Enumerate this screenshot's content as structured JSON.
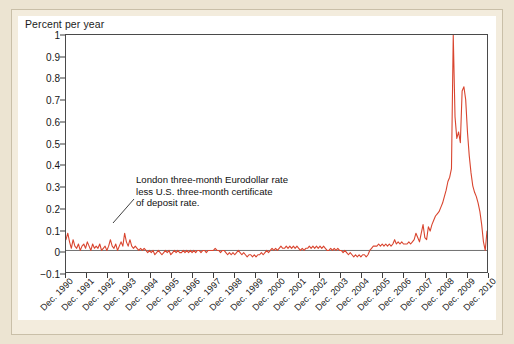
{
  "chart_data": {
    "type": "line",
    "title": "",
    "ylabel": "Percent per year",
    "xlabel": "",
    "ylim": [
      -0.1,
      1
    ],
    "grid": false,
    "legend_position": "none",
    "line_color": "#d9452f",
    "zero_line_color": "#6e6e6e",
    "y_ticks": [
      1,
      0.9,
      0.8,
      0.7,
      0.6,
      0.5,
      0.4,
      0.3,
      0.2,
      0.1,
      0,
      -0.1
    ],
    "y_tick_labels": [
      "1",
      "0.9",
      "0.8",
      "0.7",
      "0.6",
      "0.5",
      "0.4",
      "0.3",
      "0.2",
      "0.1",
      "0",
      "−0.1"
    ],
    "x_tick_labels": [
      "Dec. 1990",
      "Dec. 1991",
      "Dec. 1992",
      "Dec. 1993",
      "Dec. 1994",
      "Dec. 1995",
      "Dec. 1996",
      "Dec. 1997",
      "Dec. 1998",
      "Dec. 1999",
      "Dec. 2000",
      "Dec. 2001",
      "Dec. 2002",
      "Dec. 2003",
      "Dec. 2004",
      "Dec. 2005",
      "Dec. 2006",
      "Dec. 2007",
      "Dec. 2008",
      "Dec. 2009",
      "Dec. 2010"
    ],
    "xlim_labels": [
      "Dec. 1990",
      "Dec. 2010"
    ],
    "annotations": [
      {
        "name": "series-label",
        "lines": [
          "London three-month Eurodollar rate",
          "less U.S. three-month certificate",
          "of deposit rate."
        ],
        "leader_line": true
      }
    ],
    "series": [
      {
        "name": "London three-month Eurodollar rate less U.S. three-month certificate of deposit rate",
        "x_start": 1990.92,
        "x_step_years": 0.0833,
        "values": [
          0.05,
          0.08,
          0.04,
          0.01,
          0.05,
          0.02,
          0.01,
          0.03,
          0.0,
          0.02,
          0.03,
          0.01,
          0.04,
          0.02,
          0.0,
          0.03,
          0.01,
          0.02,
          0.01,
          0.03,
          0.0,
          0.01,
          0.02,
          0.0,
          0.02,
          0.05,
          0.02,
          0.01,
          0.03,
          0.0,
          0.02,
          0.04,
          0.02,
          0.08,
          0.04,
          0.02,
          0.05,
          0.02,
          0.01,
          0.02,
          0.01,
          0.0,
          0.01,
          0.0,
          0.01,
          0.0,
          -0.01,
          0.0,
          -0.01,
          0.0,
          -0.02,
          -0.01,
          0.0,
          -0.01,
          -0.02,
          -0.01,
          0.0,
          -0.01,
          0.0,
          -0.02,
          -0.01,
          0.0,
          -0.01,
          0.0,
          -0.01,
          -0.01,
          0.0,
          -0.01,
          0.0,
          -0.01,
          0.0,
          -0.01,
          0.0,
          -0.01,
          0.0,
          0.0,
          -0.01,
          0.0,
          0.0,
          -0.01,
          0.0,
          0.0,
          0.0,
          0.0,
          0.01,
          0.0,
          0.0,
          -0.01,
          0.0,
          0.0,
          -0.01,
          -0.02,
          -0.01,
          -0.02,
          -0.01,
          -0.02,
          -0.01,
          0.0,
          -0.01,
          -0.02,
          -0.01,
          -0.02,
          -0.03,
          -0.02,
          -0.02,
          -0.03,
          -0.02,
          -0.03,
          -0.02,
          -0.02,
          -0.01,
          -0.02,
          -0.01,
          0.0,
          -0.01,
          0.0,
          0.01,
          0.0,
          0.01,
          0.0,
          0.01,
          0.02,
          0.01,
          0.01,
          0.02,
          0.01,
          0.02,
          0.01,
          0.02,
          0.01,
          0.02,
          0.01,
          0.0,
          0.01,
          0.0,
          0.01,
          0.01,
          0.02,
          0.01,
          0.02,
          0.01,
          0.02,
          0.01,
          0.02,
          0.01,
          0.02,
          0.01,
          0.0,
          0.0,
          0.01,
          0.0,
          0.01,
          0.0,
          0.01,
          0.0,
          0.0,
          -0.01,
          0.0,
          -0.01,
          -0.02,
          -0.01,
          -0.02,
          -0.03,
          -0.02,
          -0.03,
          -0.02,
          -0.03,
          -0.02,
          -0.02,
          -0.03,
          -0.02,
          0.0,
          0.01,
          0.02,
          0.02,
          0.02,
          0.03,
          0.02,
          0.03,
          0.02,
          0.03,
          0.02,
          0.03,
          0.02,
          0.03,
          0.05,
          0.03,
          0.04,
          0.03,
          0.04,
          0.03,
          0.03,
          0.03,
          0.04,
          0.03,
          0.04,
          0.05,
          0.08,
          0.06,
          0.04,
          0.08,
          0.12,
          0.06,
          0.05,
          0.11,
          0.09,
          0.12,
          0.14,
          0.16,
          0.17,
          0.18,
          0.2,
          0.22,
          0.25,
          0.28,
          0.32,
          0.34,
          0.38,
          1.0,
          0.62,
          0.52,
          0.55,
          0.5,
          0.74,
          0.76,
          0.7,
          0.55,
          0.44,
          0.36,
          0.3,
          0.27,
          0.25,
          0.22,
          0.18,
          0.12,
          0.04,
          0.0,
          0.09
        ],
        "peak_value": 1.0,
        "peak_label": "Dec. 2008",
        "second_peak_value": 0.76,
        "min_value": -0.03
      }
    ]
  }
}
